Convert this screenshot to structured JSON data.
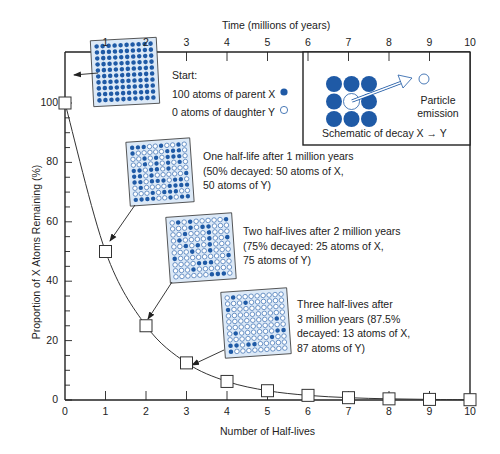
{
  "chart_data": {
    "type": "line",
    "title": "",
    "xlabel": "Number of Half-lives",
    "ylabel": "Proportion of X Atoms Remaining (%)",
    "top_xlabel": "Time (millions of years)",
    "x": [
      0,
      1,
      2,
      3,
      4,
      5,
      6,
      7,
      8,
      9,
      10
    ],
    "series": [
      {
        "name": "Proportion of X remaining",
        "values": [
          100,
          50,
          25,
          12.5,
          6.25,
          3.125,
          1.5625,
          0.78,
          0.39,
          0.2,
          0.1
        ],
        "marker": "open-square"
      }
    ],
    "xlim": [
      0,
      10
    ],
    "ylim": [
      0,
      100
    ],
    "x_ticks": [
      "0",
      "1",
      "2",
      "3",
      "4",
      "5",
      "6",
      "7",
      "8",
      "9",
      "10"
    ],
    "top_x_ticks": [
      "1",
      "2",
      "3",
      "4",
      "5",
      "6",
      "7",
      "8",
      "9",
      "10"
    ],
    "y_ticks": [
      "0",
      "20",
      "40",
      "60",
      "80",
      "100"
    ],
    "grid": false,
    "annotations": [
      {
        "point_x": 0,
        "lines": [
          "Start:",
          "100 atoms of parent X",
          "0 atoms of daughter Y"
        ],
        "parent_count": 100,
        "daughter_count": 0
      },
      {
        "point_x": 1,
        "lines": [
          "One half-life after 1 million years",
          "(50% decayed: 50 atoms of X,",
          "50 atoms of Y)"
        ],
        "parent_count": 50,
        "daughter_count": 50
      },
      {
        "point_x": 2,
        "lines": [
          "Two half-lives after 2 million years",
          "(75% decayed: 25 atoms of X,",
          "75 atoms of Y)"
        ],
        "parent_count": 25,
        "daughter_count": 75
      },
      {
        "point_x": 3,
        "lines": [
          "Three half-lives after",
          "3 million years (87.5%",
          "decayed: 13 atoms of X,",
          "87 atoms of Y)"
        ],
        "parent_count": 13,
        "daughter_count": 87
      }
    ],
    "schematic": {
      "caption": "Schematic of decay X → Y",
      "emission_label_1": "Particle",
      "emission_label_2": "emission"
    },
    "colors": {
      "parent_atom": "#1f5aa6",
      "daughter_atom_fill": "#ffffff",
      "grid_bg": "#dce9f7",
      "axis": "#222222"
    }
  }
}
